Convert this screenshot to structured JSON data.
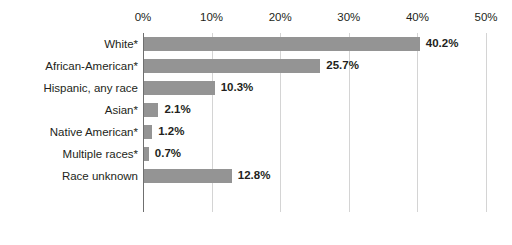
{
  "chart_data": {
    "type": "bar",
    "orientation": "horizontal",
    "title": "",
    "subtitle": "",
    "xlabel": "",
    "ylabel": "",
    "xlim": [
      0,
      50
    ],
    "xtick_labels": [
      "0%",
      "10%",
      "20%",
      "30%",
      "40%",
      "50%"
    ],
    "xticks": [
      0,
      10,
      20,
      30,
      40,
      50
    ],
    "grid": true,
    "legend": false,
    "legend_position": "none",
    "bar_color": "#949494",
    "gridline_color": "#d4d4d4",
    "axis_color": "#6f6f6f",
    "text_color": "#231f20",
    "categories": [
      "White*",
      "African-American*",
      "Hispanic, any race",
      "Asian*",
      "Native American*",
      "Multiple races*",
      "Race unknown"
    ],
    "values": [
      40.2,
      25.7,
      10.3,
      2.1,
      1.2,
      0.7,
      12.8
    ],
    "value_labels": [
      "40.2%",
      "25.7%",
      "10.3%",
      "2.1%",
      "1.2%",
      "0.7%",
      "12.8%"
    ]
  }
}
